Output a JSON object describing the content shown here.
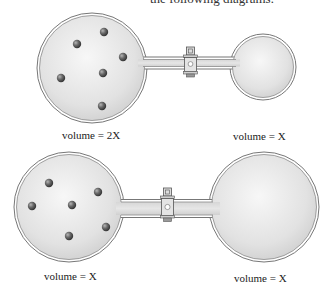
{
  "header": {
    "text": "the following diagrams:"
  },
  "diagrams": [
    {
      "name": "top",
      "left_flask": {
        "label": "volume = 2X",
        "gas_particles": 6
      },
      "right_flask": {
        "label": "volume = X",
        "gas_particles": 0
      },
      "valve": "closed"
    },
    {
      "name": "bottom",
      "left_flask": {
        "label": "volume = X",
        "gas_particles": 6
      },
      "right_flask": {
        "label": "volume = X",
        "gas_particles": 0
      },
      "valve": "closed"
    }
  ],
  "colors": {
    "glass_fill": "#e4e4e4",
    "glass_edge": "#6e6e6e",
    "particle": "#555555",
    "valve": "#d8d8d8"
  }
}
